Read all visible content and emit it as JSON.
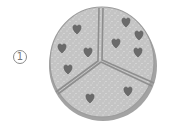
{
  "label": "1",
  "illustration": {
    "subject": "round cookie divided into 3 pieces",
    "pieces": 3,
    "icon": "cookie-icon",
    "chips_per_piece": [
      4,
      4,
      2
    ],
    "colors": {
      "dough": "#c6c6c6",
      "rim": "#9a9a9a",
      "divider": "#8c8c8c",
      "chip": "#6e6e6e"
    }
  }
}
